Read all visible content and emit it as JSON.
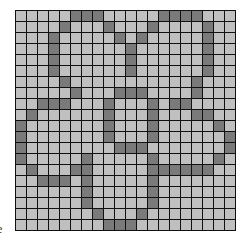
{
  "board": {
    "rows": 20,
    "cols": 20,
    "colors": {
      "off": "#c0c0c0",
      "on": "#7a7a7a",
      "grid_line": "#111111"
    },
    "filled_cells_by_row": [
      [
        5,
        6,
        7,
        13,
        14,
        15,
        16
      ],
      [
        4,
        8,
        12,
        17
      ],
      [
        3,
        9,
        11,
        17
      ],
      [
        3,
        10,
        17
      ],
      [
        3,
        10,
        17
      ],
      [
        3,
        10,
        17
      ],
      [
        4,
        16
      ],
      [
        5,
        9,
        10,
        11,
        16
      ],
      [
        2,
        3,
        4,
        8,
        12,
        14,
        15
      ],
      [
        1,
        8,
        12,
        16,
        17
      ],
      [
        0,
        8,
        12,
        18
      ],
      [
        0,
        8,
        12,
        19
      ],
      [
        0,
        9,
        10,
        11,
        19
      ],
      [
        0,
        6,
        12,
        18
      ],
      [
        1,
        5,
        6,
        12,
        13,
        14,
        15,
        16,
        17
      ],
      [
        2,
        3,
        4,
        6,
        12
      ],
      [
        6,
        12
      ],
      [
        6,
        12
      ],
      [
        7,
        11
      ],
      [
        8,
        9,
        10
      ]
    ]
  },
  "edge_label": "e"
}
